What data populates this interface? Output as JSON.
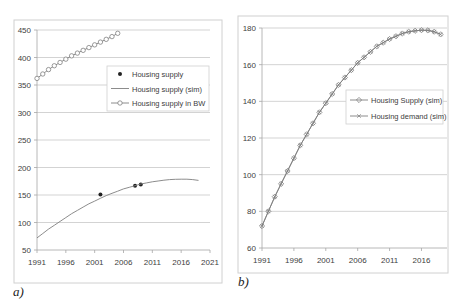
{
  "chart_data": [
    {
      "id": "a",
      "type": "line",
      "caption": "a)",
      "title": "",
      "xlabel": "",
      "ylabel": "",
      "xlim": [
        1991,
        2021
      ],
      "ylim": [
        50,
        450
      ],
      "xticks": [
        1991,
        1996,
        2001,
        2006,
        2011,
        2016,
        2021
      ],
      "yticks": [
        50,
        100,
        150,
        200,
        250,
        300,
        350,
        400,
        450
      ],
      "grid": "horizontal",
      "legend_position": "inside-right-upper",
      "series": [
        {
          "name": "Housing supply",
          "style": "markers-filled",
          "x": [
            2002,
            2008,
            2009
          ],
          "y": [
            151,
            167,
            169
          ]
        },
        {
          "name": "Housing supply (sim)",
          "style": "line",
          "x": [
            1991,
            1992,
            1993,
            1994,
            1995,
            1996,
            1997,
            1998,
            1999,
            2000,
            2001,
            2002,
            2003,
            2004,
            2005,
            2006,
            2007,
            2008,
            2009,
            2010,
            2011,
            2012,
            2013,
            2014,
            2015,
            2016,
            2017,
            2018,
            2019
          ],
          "y": [
            72,
            80,
            88,
            95,
            102,
            109,
            116,
            122,
            128,
            134,
            139,
            144,
            149,
            153,
            157,
            161,
            164,
            167,
            170,
            172,
            174,
            175.5,
            177,
            178,
            178.5,
            178.8,
            178.7,
            178,
            176.5
          ]
        },
        {
          "name": "Housing supply in BW",
          "style": "line-open-markers",
          "x": [
            1991,
            1992,
            1993,
            1994,
            1995,
            1996,
            1997,
            1998,
            1999,
            2000,
            2001,
            2002,
            2003,
            2004,
            2005
          ],
          "y": [
            362,
            370,
            378,
            385,
            391,
            397,
            403,
            408,
            413,
            418,
            423,
            428,
            433,
            438,
            444
          ]
        }
      ]
    },
    {
      "id": "b",
      "type": "line",
      "caption": "b)",
      "title": "",
      "xlabel": "",
      "ylabel": "",
      "xlim": [
        1991,
        2020
      ],
      "ylim": [
        60,
        180
      ],
      "xticks": [
        1991,
        1996,
        2001,
        2006,
        2011,
        2016
      ],
      "yticks": [
        60,
        80,
        100,
        120,
        140,
        160,
        180
      ],
      "grid": "horizontal",
      "legend_position": "inside-right-middle",
      "series": [
        {
          "name": "Housing Supply (sim)",
          "style": "line-open-diamond",
          "x": [
            1991,
            1992,
            1993,
            1994,
            1995,
            1996,
            1997,
            1998,
            1999,
            2000,
            2001,
            2002,
            2003,
            2004,
            2005,
            2006,
            2007,
            2008,
            2009,
            2010,
            2011,
            2012,
            2013,
            2014,
            2015,
            2016,
            2017,
            2018,
            2019
          ],
          "y": [
            72,
            80,
            88,
            95,
            102,
            109,
            116,
            122,
            128,
            134,
            139,
            144,
            149,
            153,
            157,
            161,
            164,
            167,
            170,
            172,
            174,
            175.5,
            177,
            178,
            178.5,
            178.8,
            178.7,
            178,
            176.5
          ]
        },
        {
          "name": "Housing demand (sim)",
          "style": "line-cross",
          "x": [
            1991,
            1992,
            1993,
            1994,
            1995,
            1996,
            1997,
            1998,
            1999,
            2000,
            2001,
            2002,
            2003,
            2004,
            2005,
            2006,
            2007,
            2008,
            2009,
            2010,
            2011,
            2012,
            2013,
            2014,
            2015,
            2016,
            2017,
            2018,
            2019
          ],
          "y": [
            72,
            80,
            88,
            95,
            102,
            109,
            116,
            122,
            128,
            134,
            139,
            144,
            149,
            153,
            157,
            161,
            164,
            167,
            170,
            172,
            174,
            175.5,
            177,
            178,
            178.5,
            178.8,
            178.7,
            178,
            176.5
          ]
        }
      ]
    }
  ],
  "colors": {
    "axis": "#a6a6a6",
    "grid": "#c8c8c8",
    "frame": "#d0d0d0",
    "line": "#7f7f7f",
    "marker": "#808080",
    "filled_marker": "#222222",
    "text": "#404040"
  }
}
